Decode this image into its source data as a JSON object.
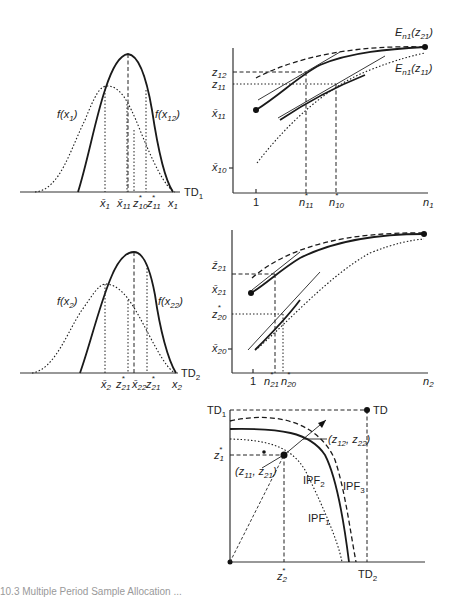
{
  "panels": {
    "top_left": {
      "curve_labels": {
        "f_x1": "f(x",
        "f_x1_sub": "1",
        "f_x12": "f(x",
        "f_x12_sub": "12"
      },
      "axis_end": "TD",
      "axis_end_sub": "1",
      "ticks": [
        "x̄",
        "x̄",
        "z",
        "z",
        "x"
      ],
      "tick_subs": [
        "1",
        "11",
        "10",
        "11",
        "1"
      ],
      "tick_sups": [
        "",
        "",
        "*",
        "*",
        ""
      ]
    },
    "top_right": {
      "y_ticks": [
        "z",
        "z",
        "x̄",
        "x̄"
      ],
      "y_tick_subs": [
        "12",
        "11",
        "11",
        "10"
      ],
      "x_ticks": [
        "1",
        "n",
        "n",
        "n"
      ],
      "x_tick_subs": [
        "",
        "11",
        "10",
        "1"
      ],
      "x_tick_sups": [
        "",
        "*",
        "*",
        ""
      ],
      "curve_labels": {
        "upper": "E",
        "upper_sub": "n1",
        "upper_arg": "(z",
        "upper_arg_sub": "21",
        "lower": "E",
        "lower_sub": "n1",
        "lower_arg": "(z",
        "lower_arg_sub": "11"
      }
    },
    "mid_left": {
      "curve_labels": {
        "f_x2": "f(x",
        "f_x2_sub": "2",
        "f_x22": "f(x",
        "f_x22_sub": "22"
      },
      "axis_end": "TD",
      "axis_end_sub": "2",
      "ticks": [
        "x̄",
        "z",
        "x̄",
        "z",
        "x"
      ],
      "tick_subs": [
        "2",
        "21",
        "22",
        "21",
        "2"
      ],
      "tick_sups": [
        "",
        "*",
        "",
        "*",
        ""
      ]
    },
    "mid_right": {
      "y_ticks": [
        "z̄",
        "x̄",
        "z",
        "x̄"
      ],
      "y_tick_subs": [
        "21",
        "21",
        "20",
        "20"
      ],
      "y_tick_sups": [
        "",
        "",
        "*",
        ""
      ],
      "x_ticks": [
        "1",
        "n",
        "n",
        "n"
      ],
      "x_tick_subs": [
        "",
        "21",
        "20",
        "2"
      ],
      "x_tick_sups": [
        "",
        "*",
        "*",
        ""
      ]
    },
    "bottom": {
      "y_label": "TD",
      "y_label_sub": "1",
      "corner_label": "TD",
      "x_label": "TD",
      "x_label_sub": "2",
      "y_tick": "z",
      "y_tick_sub": "1",
      "y_tick_sup": "*",
      "x_tick": "z",
      "x_tick_sub": "2",
      "x_tick_sup": "*",
      "point_outer": "(z",
      "point_outer_s1": "12",
      "point_outer_mid": ", z",
      "point_outer_s2": "22",
      "point_outer_end": ")",
      "point_inner": "(z",
      "point_inner_s1": "11",
      "point_inner_mid": ", z",
      "point_inner_s2": "21",
      "point_inner_end": ")",
      "frontiers": [
        {
          "name": "IPF",
          "sub": "1",
          "style": "dotted"
        },
        {
          "name": "IPF",
          "sub": "2",
          "style": "solid"
        },
        {
          "name": "IPF",
          "sub": "3",
          "style": "dashed"
        }
      ]
    }
  },
  "caption": "10.3 Multiple Period Sample Allocation ..."
}
